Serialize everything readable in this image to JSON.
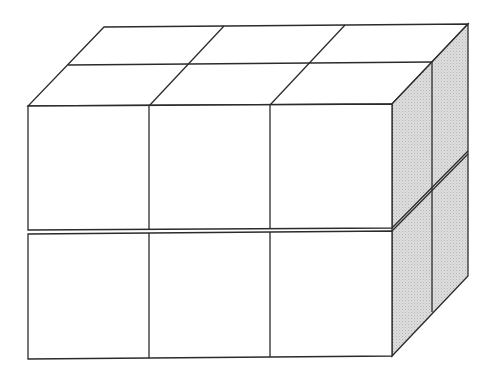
{
  "diagram": {
    "type": "isometric-cube-stack",
    "dimensions": {
      "width_cubes": 3,
      "depth_cubes": 2,
      "height_cubes": 2
    },
    "total_cubes": 12,
    "colors": {
      "line": "#2b2b2b",
      "front_face": "#ffffff",
      "top_face": "#ffffff",
      "side_face": "#d4d4d4"
    }
  }
}
